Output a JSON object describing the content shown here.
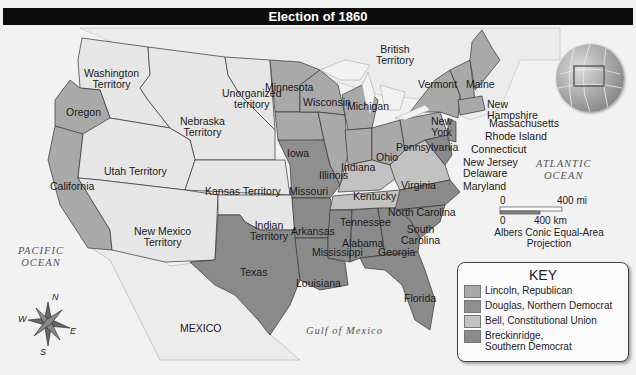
{
  "title": "Election of 1860",
  "colors": {
    "lincoln": "#a9a9a9",
    "douglas": "#8f8f8f",
    "bell": "#c2c2c2",
    "breckinridge": "#8a8a8a",
    "territory": "#e6e6e6",
    "water": "#f2f2f2",
    "title_bar": "#0d0d0d"
  },
  "regions": {
    "territories": [
      "Washington Territory",
      "Unorganized territory",
      "Nebraska Territory",
      "Utah Territory",
      "Kansas Territory",
      "New Mexico Territory",
      "Indian Territory"
    ],
    "foreign": [
      "British Territory",
      "MEXICO"
    ],
    "lincoln_states": [
      "Oregon",
      "California",
      "Minnesota",
      "Wisconsin",
      "Michigan",
      "Iowa",
      "Illinois",
      "Indiana",
      "Ohio",
      "Pennsylvania",
      "New York",
      "Vermont",
      "Maine",
      "New Hampshire",
      "Massachusetts",
      "Rhode Island",
      "Connecticut",
      "New Jersey"
    ],
    "douglas_states": [
      "Missouri",
      "New Jersey"
    ],
    "bell_states": [
      "Virginia",
      "Kentucky",
      "Tennessee"
    ],
    "breckinridge_states": [
      "Texas",
      "Arkansas",
      "Louisiana",
      "Mississippi",
      "Alabama",
      "Georgia",
      "Florida",
      "South Carolina",
      "North Carolina",
      "Maryland",
      "Delaware"
    ]
  },
  "labels": {
    "washington": [
      "Washington",
      "Territory"
    ],
    "oregon": "Oregon",
    "california": "California",
    "nebraska": [
      "Nebraska",
      "Territory"
    ],
    "unorganized": [
      "Unorganized",
      "territory"
    ],
    "utah": "Utah Territory",
    "kansas": "Kansas Territory",
    "new_mexico": [
      "New Mexico",
      "Territory"
    ],
    "indian": [
      "Indian",
      "Territory"
    ],
    "texas": "Texas",
    "mexico": "MEXICO",
    "british": [
      "British",
      "Territory"
    ],
    "minnesota": "Minnesota",
    "wisconsin": "Wisconsin",
    "michigan": "Michigan",
    "iowa": "Iowa",
    "illinois": "Illinois",
    "indiana": "Indiana",
    "ohio": "Ohio",
    "missouri": "Missouri",
    "kentucky": "Kentucky",
    "tennessee": "Tennessee",
    "arkansas": "Arkansas",
    "mississippi": "Mississippi",
    "alabama": "Alabama",
    "georgia": "Georgia",
    "louisiana": "Louisiana",
    "florida": "Florida",
    "south_carolina": [
      "South",
      "Carolina"
    ],
    "north_carolina": "North Carolina",
    "virginia": "Virginia",
    "pennsylvania": "Pennsylvania",
    "new_york": [
      "New",
      "York"
    ],
    "vermont": "Vermont",
    "maine": "Maine",
    "new_hampshire": [
      "New",
      "Hampshire"
    ],
    "massachusetts": "Massachusetts",
    "rhode_island": "Rhode Island",
    "connecticut": "Connecticut",
    "new_jersey": "New Jersey",
    "delaware": "Delaware",
    "maryland": "Maryland"
  },
  "oceans": {
    "pacific": [
      "PACIFIC",
      "OCEAN"
    ],
    "atlantic": [
      "ATLANTIC",
      "OCEAN"
    ],
    "gulf": "Gulf of Mexico"
  },
  "scale": {
    "zero_top": "0",
    "miles": "400 mi",
    "zero_bottom": "0",
    "km": "400 km",
    "projection": [
      "Albers Conic Equal-Area",
      "Projection"
    ]
  },
  "compass": {
    "n": "N",
    "s": "S",
    "e": "E",
    "w": "W"
  },
  "key": {
    "title": "KEY",
    "items": [
      {
        "label": "Lincoln, Republican",
        "color": "#a9a9a9"
      },
      {
        "label": "Douglas, Northern Democrat",
        "color": "#8f8f8f"
      },
      {
        "label": "Bell, Constitutional Union",
        "color": "#c2c2c2"
      },
      {
        "label": "Breckinridge,",
        "label2": "Southern Democrat",
        "color": "#8a8a8a"
      }
    ]
  }
}
